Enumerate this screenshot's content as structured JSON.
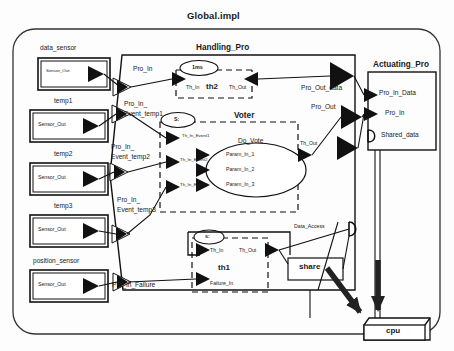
{
  "diagram": {
    "title": "Global.impl",
    "type": "aadl-architecture-diagram",
    "colors": {
      "line": "#1a1a1a",
      "background": "#fdfdfd",
      "text": "#1a1a1a"
    }
  },
  "sensors": [
    {
      "name": "data_sensor",
      "port": "Sensor_Out"
    },
    {
      "name": "temp1",
      "port": "Sensor_Out"
    },
    {
      "name": "temp2",
      "port": "Sensor_Out"
    },
    {
      "name": "temp3",
      "port": "Sensor_Out"
    },
    {
      "name": "position_sensor",
      "port": "Sensor_Out"
    }
  ],
  "handling_pro": {
    "title": "Handling_Pro",
    "in_ports": [
      "Pro_In",
      "Pro_In_",
      "Event_temp1",
      "Pro_In_",
      "Event_temp2",
      "Pro_In_",
      "Event_temp3",
      "Pro_In_Failure"
    ],
    "out_ports": [
      "Pro_Out_data",
      "Pro_Out"
    ],
    "threads": [
      {
        "name": "th2",
        "annotation": "1ms",
        "ports": [
          "Th_In",
          "Th_Out"
        ]
      },
      {
        "name": "Voter",
        "annotation": "S:",
        "subprogram": "Do_Vote",
        "in_ports": [
          "Th_In_Event1",
          "Th_In_Event2",
          "Th_In_Event3"
        ],
        "params": [
          "Param_In_1",
          "Param_In_2",
          "Param_In_3"
        ],
        "out_ports": [
          "Th_Out"
        ]
      },
      {
        "name": "th1",
        "annotation": "s:",
        "ports": [
          "Th_In",
          "Th_Out",
          "Failure_In"
        ]
      }
    ],
    "data_access": "Data_Access",
    "shared_box": "share"
  },
  "actuating_pro": {
    "title": "Actuating_Pro",
    "ports": [
      "Pro_In_Data",
      "Pro_In",
      "Shared_data"
    ]
  },
  "processor": {
    "label": "cpu"
  }
}
